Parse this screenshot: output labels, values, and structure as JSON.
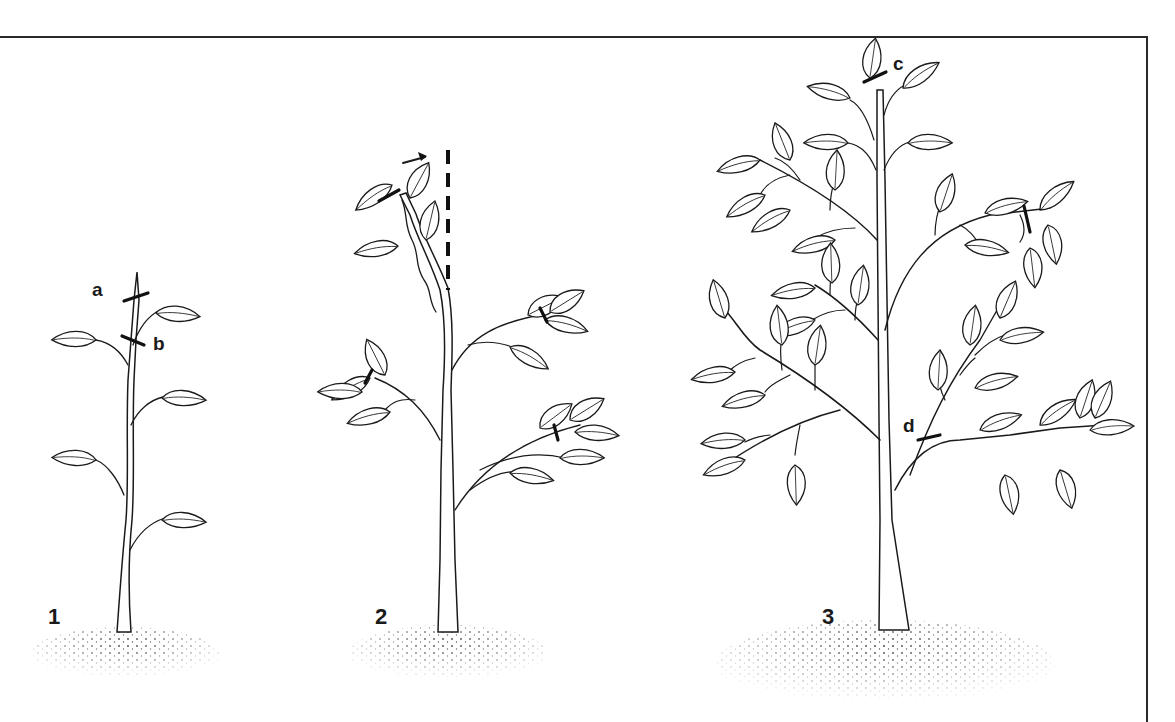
{
  "figure": {
    "stages": [
      {
        "number": "1",
        "cut_labels": [
          "a",
          "b"
        ]
      },
      {
        "number": "2",
        "cut_labels": []
      },
      {
        "number": "3",
        "cut_labels": [
          "c",
          "d"
        ]
      }
    ],
    "annotations": {
      "stake": "dashed-vertical-stake",
      "direction_arrow": "arrow-right"
    },
    "colors": {
      "ink": "#1a1a1a",
      "background": "#ffffff"
    }
  }
}
